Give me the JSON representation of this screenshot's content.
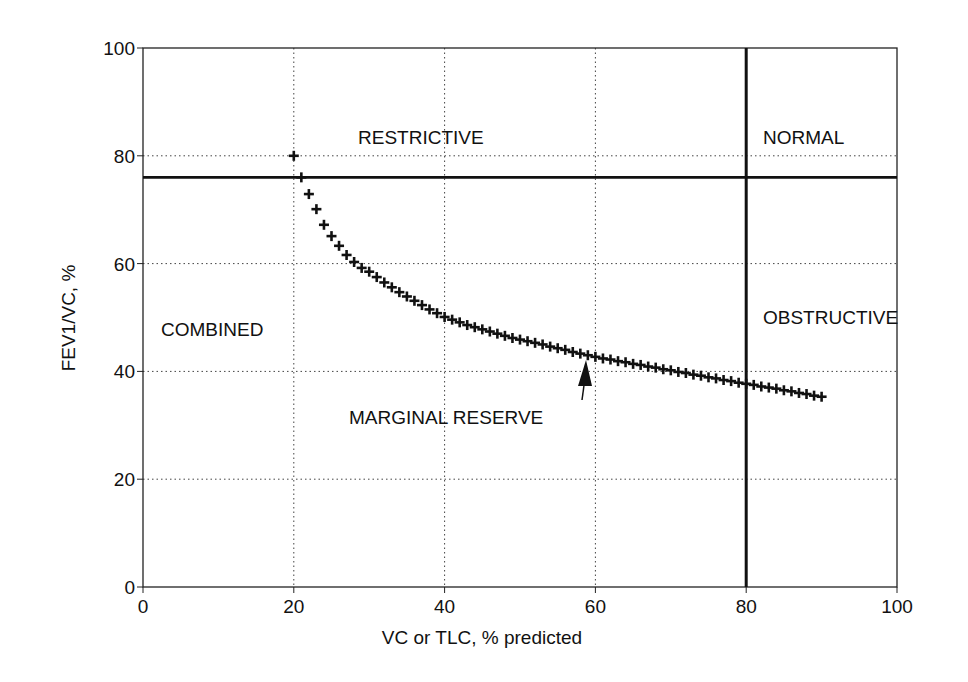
{
  "chart_data": {
    "type": "scatter",
    "title": "",
    "xlabel": "VC or TLC, % predicted",
    "ylabel": "FEV1/VC, %",
    "xlim": [
      0,
      100
    ],
    "ylim": [
      0,
      100
    ],
    "xticks": [
      0,
      20,
      40,
      60,
      80,
      100
    ],
    "yticks": [
      0,
      20,
      40,
      60,
      80,
      100
    ],
    "grid": true,
    "grid_style": "dotted",
    "legend": null,
    "series": [
      {
        "name": "Marginal reserve",
        "marker": "+",
        "x": [
          20,
          21,
          22,
          23,
          24,
          25,
          26,
          27,
          28,
          29,
          30,
          31,
          32,
          33,
          34,
          35,
          36,
          37,
          38,
          39,
          40,
          41,
          42,
          43,
          44,
          45,
          46,
          47,
          48,
          49,
          50,
          51,
          52,
          53,
          54,
          55,
          56,
          57,
          58,
          59,
          60,
          61,
          62,
          63,
          64,
          65,
          66,
          67,
          68,
          69,
          70,
          71,
          72,
          73,
          74,
          75,
          76,
          77,
          78,
          79,
          80,
          81,
          82,
          83,
          84,
          85,
          86,
          87,
          88,
          89,
          90
        ],
        "y": [
          80,
          76,
          72.9,
          70.1,
          67.2,
          65.1,
          63.3,
          61.6,
          60.3,
          59.2,
          58.5,
          57.5,
          56.5,
          55.6,
          54.7,
          53.9,
          53.1,
          52.3,
          51.5,
          50.8,
          50.1,
          49.6,
          49.1,
          48.6,
          48.2,
          47.8,
          47.4,
          47.0,
          46.6,
          46.2,
          45.9,
          45.6,
          45.3,
          45.0,
          44.6,
          44.3,
          44.0,
          43.6,
          43.3,
          43.0,
          42.7,
          42.4,
          42.2,
          41.9,
          41.7,
          41.4,
          41.2,
          40.9,
          40.7,
          40.4,
          40.2,
          39.9,
          39.7,
          39.4,
          39.2,
          38.9,
          38.7,
          38.4,
          38.2,
          37.9,
          37.7,
          37.5,
          37.2,
          37.0,
          36.8,
          36.5,
          36.3,
          36.0,
          35.8,
          35.5,
          35.3
        ]
      }
    ],
    "reference_lines": [
      {
        "orientation": "horizontal",
        "value": 76,
        "style": "solid-thick"
      },
      {
        "orientation": "vertical",
        "value": 80,
        "style": "solid-thick"
      }
    ],
    "annotations": [
      {
        "text": "RESTRICTIVE",
        "x": 29,
        "y": 83
      },
      {
        "text": "NORMAL",
        "x": 82.5,
        "y": 83
      },
      {
        "text": "COMBINED",
        "x": 2.5,
        "y": 48
      },
      {
        "text": "OBSTRUCTIVE",
        "x": 82.5,
        "y": 50
      },
      {
        "text": "MARGINAL RESERVE",
        "x": 27.5,
        "y": 29.5,
        "arrow_to": [
          59,
          42.5
        ]
      }
    ]
  },
  "labels": {
    "xlabel": "VC or TLC, % predicted",
    "ylabel": "FEV1/VC, %",
    "restrictive": "RESTRICTIVE",
    "normal": "NORMAL",
    "combined": "COMBINED",
    "obstructive": "OBSTRUCTIVE",
    "marginal_reserve": "MARGINAL RESERVE"
  }
}
